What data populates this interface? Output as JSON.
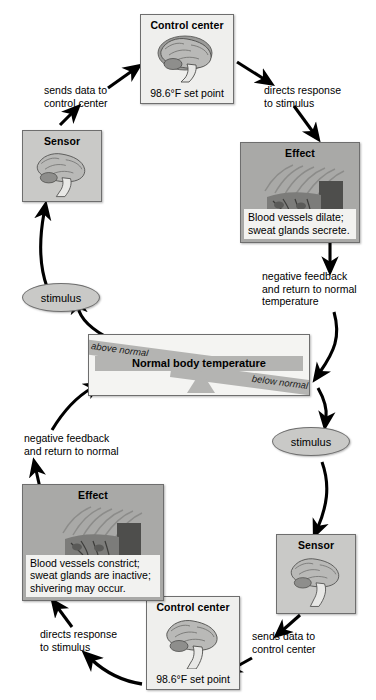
{
  "diagram": {
    "colors": {
      "box_border": "#6e6e6e",
      "box_fill_light": "#c9c9c7",
      "box_fill_white": "#efefed",
      "effect_fill": "#a9a9a7",
      "bar_fill": "#b4b4b2",
      "panel_fill": "#f4f4f2",
      "arrow": "#000000"
    }
  },
  "top_loop": {
    "control_center": {
      "title": "Control center",
      "setpoint": "98.6°F set point",
      "icon": "brain-icon"
    },
    "sensor": {
      "title": "Sensor",
      "icon": "brain-icon"
    },
    "effect": {
      "title": "Effect",
      "caption": "Blood vessels dilate;\nsweat glands secrete.",
      "icon": "skin-sweat-gland-icon"
    },
    "stimulus": {
      "label": "stimulus"
    },
    "arrows": {
      "sensor_to_control": "sends data to\ncontrol center",
      "control_to_effect": "directs response\nto stimulus",
      "effect_to_normal": "negative feedback\nand return to normal\ntemperature"
    }
  },
  "center": {
    "normal_label": "Normal body temperature",
    "above_label": "above normal",
    "below_label": "below normal"
  },
  "bottom_loop": {
    "control_center": {
      "title": "Control center",
      "setpoint": "98.6°F set point",
      "icon": "brain-icon"
    },
    "sensor": {
      "title": "Sensor",
      "icon": "brain-icon"
    },
    "effect": {
      "title": "Effect",
      "caption": "Blood vessels constrict;\nsweat glands are inactive;\nshivering may occur.",
      "icon": "skin-sweat-gland-icon"
    },
    "stimulus": {
      "label": "stimulus"
    },
    "arrows": {
      "sensor_to_control": "sends data to\ncontrol center",
      "control_to_effect": "directs response\nto stimulus",
      "effect_to_normal": "negative feedback\nand return to normal"
    }
  }
}
